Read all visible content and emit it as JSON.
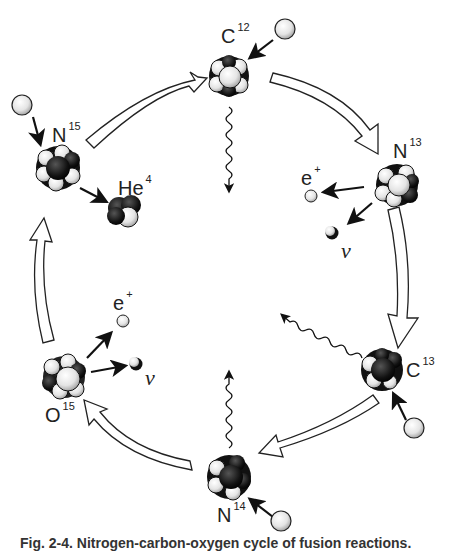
{
  "diagram": {
    "type": "carbon-nitrogen-oxygen-cycle",
    "colors": {
      "ink": "#1a1a1a",
      "paper": "#ffffff",
      "nucleon_light": "#e6e6e6",
      "nucleon_dark": "#111111"
    },
    "nuclei": [
      {
        "id": "c12",
        "symbol": "C",
        "mass": "12"
      },
      {
        "id": "n13",
        "symbol": "N",
        "mass": "13"
      },
      {
        "id": "c13",
        "symbol": "C",
        "mass": "13"
      },
      {
        "id": "n14",
        "symbol": "N",
        "mass": "14"
      },
      {
        "id": "o15",
        "symbol": "O",
        "mass": "15"
      },
      {
        "id": "n15",
        "symbol": "N",
        "mass": "15"
      },
      {
        "id": "he4",
        "symbol": "He",
        "mass": "4"
      }
    ],
    "particles": {
      "positron": {
        "symbol": "e",
        "charge": "+"
      },
      "neutrino": {
        "symbol": "ν"
      }
    },
    "steps": [
      "C12 + proton → N13 + gamma",
      "N13 → C13 + positron + neutrino",
      "C13 + proton → N14 + gamma",
      "N14 + proton → O15 + gamma",
      "O15 → N15 + positron + neutrino",
      "N15 + proton → C12 + He4"
    ]
  },
  "caption": "Fig. 2-4. Nitrogen-carbon-oxygen cycle of fusion reactions."
}
